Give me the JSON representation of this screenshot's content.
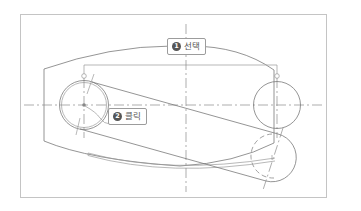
{
  "diagram": {
    "colors": {
      "line": "#7a7a7a",
      "frame": "#c4c4c4",
      "badge": "#555555",
      "callout_text": "#555555"
    }
  },
  "callouts": [
    {
      "number": "1",
      "label": "선택",
      "meaning": "Select"
    },
    {
      "number": "2",
      "label": "클릭",
      "meaning": "Click"
    }
  ]
}
